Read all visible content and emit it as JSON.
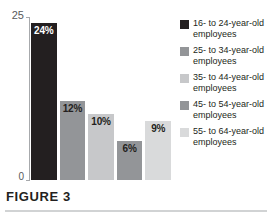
{
  "caption": {
    "label": "FIGURE 3"
  },
  "chart_data": {
    "type": "bar",
    "title": "",
    "xlabel": "",
    "ylabel": "",
    "ylim": [
      0,
      25
    ],
    "ytick_labels": [
      "25",
      "0"
    ],
    "grid": false,
    "legend_position": "right",
    "categories": [
      "16- to 24-year-old employees",
      "25- to 34-year-old employees",
      "35- to 44-year-old employees",
      "45- to 54-year-old employees",
      "55- to 64-year-old employees"
    ],
    "values": [
      24,
      12,
      10,
      6,
      9
    ],
    "data_labels": [
      "24%",
      "12%",
      "10%",
      "6%",
      "9%"
    ],
    "colors": [
      "#231f20",
      "#939598",
      "#c7c8ca",
      "#939598",
      "#d9dadb"
    ],
    "label_colors": [
      "#ffffff",
      "#231f20",
      "#231f20",
      "#231f20",
      "#231f20"
    ]
  },
  "legend": {
    "items": [
      {
        "label": "16- to 24-year-old employees",
        "color": "#231f20"
      },
      {
        "label": "25- to 34-year-old employees",
        "color": "#939598"
      },
      {
        "label": "35- to 44-year-old employees",
        "color": "#c7c8ca"
      },
      {
        "label": "45- to 54-year-old employees",
        "color": "#939598"
      },
      {
        "label": "55- to 64-year-old employees",
        "color": "#d9dadb"
      }
    ]
  }
}
